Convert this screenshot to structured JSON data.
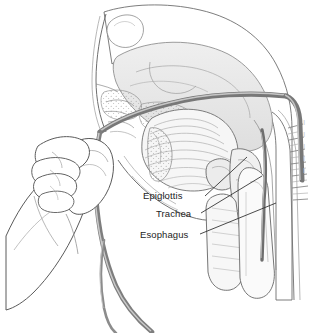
{
  "figure": {
    "background_color": "#ffffff",
    "width": 314,
    "height": 333
  },
  "labels": [
    {
      "id": "epiglottis",
      "text": "Epiglottis",
      "x": 143,
      "y": 190
    },
    {
      "id": "trachea",
      "text": "Trachea",
      "x": 156,
      "y": 208
    },
    {
      "id": "esophagus",
      "text": "Esophagus",
      "x": 140,
      "y": 229
    }
  ],
  "edge_labels": [
    {
      "text": "I",
      "y": 122
    },
    {
      "text": "I",
      "y": 134
    },
    {
      "text": "I",
      "y": 146
    },
    {
      "text": "I",
      "y": 158
    },
    {
      "text": "I",
      "y": 170
    }
  ],
  "leader_lines": [
    {
      "id": "epiglottis-leader",
      "from": [
        205,
        196
      ],
      "to": [
        247,
        157
      ]
    },
    {
      "id": "trachea-leader",
      "from": [
        201,
        213
      ],
      "to": [
        262,
        176
      ]
    },
    {
      "id": "esophagus-leader",
      "from": [
        200,
        234
      ],
      "to": [
        276,
        203
      ]
    }
  ],
  "anatomy": {
    "head_outline": "sagittal section of head and neck",
    "nasal_cavity": "nasal turbinates with stippling",
    "tongue": "hatched tongue body in oral cavity",
    "soft_palate": "soft palate and uvula",
    "epiglottis_shape": "epiglottic cartilage",
    "trachea_shape": "tracheal lumen anterior",
    "esophagus_shape": "esophageal lumen posterior",
    "cervical_spine": "cervical vertebrae with hatch marks",
    "brain_region": "cranial base and sphenoid sinus"
  },
  "instrument": {
    "name": "nasogastric-tube",
    "description": "flexible tube entering nostril and curving down through nasopharynx",
    "color_dark": "#6b6b6b",
    "color_light": "#d8d8d8"
  },
  "hand": {
    "description": "hand gripping tube between thumb and curled fingers",
    "line_color": "#4a4a4a"
  },
  "colors": {
    "stroke": "#555555",
    "label_text": "#1d1d1d",
    "leader_line": "#2b2b2b",
    "tissue_fill": "#e8e8e8",
    "tissue_fill_light": "#f4f4f4",
    "tube_dark": "#707070",
    "edge_text": "#c9c9c9"
  }
}
